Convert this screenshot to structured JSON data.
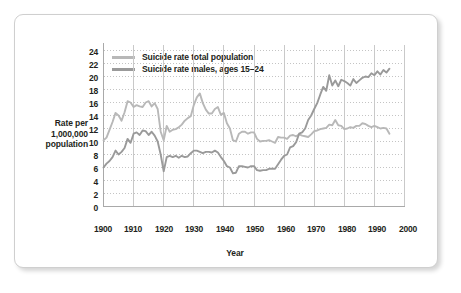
{
  "chart_data": {
    "type": "line",
    "title": "",
    "xlabel": "Year",
    "ylabel": "Rate per 1,000,000 population",
    "ylabel_lines": [
      "Rate per",
      "1,000,000",
      "population"
    ],
    "xlim": [
      1900,
      2000
    ],
    "ylim": [
      0,
      24
    ],
    "xticks": [
      1900,
      1910,
      1920,
      1930,
      1940,
      1950,
      1960,
      1970,
      1980,
      1990,
      2000
    ],
    "yticks": [
      0,
      2,
      4,
      6,
      8,
      10,
      12,
      14,
      16,
      18,
      20,
      22,
      24
    ],
    "grid": "horizontal dotted, vertical solid light gray",
    "legend_position": "top-left inside plot",
    "series": [
      {
        "name": "Suicide rate total population",
        "color": "#b8b8b8",
        "x": [
          1900,
          1901,
          1902,
          1903,
          1904,
          1905,
          1906,
          1907,
          1908,
          1909,
          1910,
          1911,
          1912,
          1913,
          1914,
          1915,
          1916,
          1917,
          1918,
          1919,
          1920,
          1921,
          1922,
          1923,
          1924,
          1925,
          1926,
          1927,
          1928,
          1929,
          1930,
          1931,
          1932,
          1933,
          1934,
          1935,
          1936,
          1937,
          1938,
          1939,
          1940,
          1941,
          1942,
          1943,
          1944,
          1945,
          1946,
          1947,
          1948,
          1949,
          1950,
          1951,
          1952,
          1953,
          1954,
          1955,
          1956,
          1957,
          1958,
          1959,
          1960,
          1961,
          1962,
          1963,
          1964,
          1965,
          1966,
          1967,
          1968,
          1969,
          1970,
          1971,
          1972,
          1973,
          1974,
          1975,
          1976,
          1977,
          1978,
          1979,
          1980,
          1981,
          1982,
          1983,
          1984,
          1985,
          1986,
          1987,
          1988,
          1989,
          1990,
          1991,
          1992,
          1993,
          1994,
          1995
        ],
        "y": [
          10.2,
          10.6,
          11.8,
          13.0,
          14.4,
          14.0,
          13.2,
          14.5,
          16.2,
          16.0,
          15.3,
          15.6,
          15.4,
          15.3,
          16.0,
          16.2,
          15.4,
          15.9,
          15.0,
          11.5,
          10.2,
          12.4,
          11.5,
          11.8,
          11.9,
          12.2,
          12.6,
          13.2,
          13.6,
          13.9,
          15.6,
          16.8,
          17.4,
          15.9,
          14.9,
          14.3,
          14.3,
          15.0,
          15.3,
          14.1,
          14.4,
          12.8,
          12.0,
          10.2,
          10.0,
          11.2,
          11.5,
          11.5,
          11.2,
          11.4,
          11.4,
          10.4,
          10.0,
          10.1,
          10.1,
          10.2,
          10.0,
          9.8,
          10.7,
          10.6,
          10.6,
          10.4,
          10.9,
          11.0,
          10.8,
          11.1,
          10.9,
          10.8,
          10.7,
          11.1,
          11.6,
          11.7,
          11.9,
          12.0,
          12.1,
          12.6,
          12.5,
          13.3,
          12.5,
          12.4,
          11.9,
          12.0,
          12.2,
          12.1,
          12.4,
          12.4,
          12.8,
          12.7,
          12.4,
          12.2,
          12.4,
          12.2,
          12.0,
          12.1,
          12.0,
          11.2
        ]
      },
      {
        "name": "Suicide rate males, ages 15–24",
        "color": "#9a9a9a",
        "x": [
          1900,
          1901,
          1902,
          1903,
          1904,
          1905,
          1906,
          1907,
          1908,
          1909,
          1910,
          1911,
          1912,
          1913,
          1914,
          1915,
          1916,
          1917,
          1918,
          1919,
          1920,
          1921,
          1922,
          1923,
          1924,
          1925,
          1926,
          1927,
          1928,
          1929,
          1930,
          1931,
          1932,
          1933,
          1934,
          1935,
          1936,
          1937,
          1938,
          1939,
          1940,
          1941,
          1942,
          1943,
          1944,
          1945,
          1946,
          1947,
          1948,
          1949,
          1950,
          1951,
          1952,
          1953,
          1954,
          1955,
          1956,
          1957,
          1958,
          1959,
          1960,
          1961,
          1962,
          1963,
          1964,
          1965,
          1966,
          1967,
          1968,
          1969,
          1970,
          1971,
          1972,
          1973,
          1974,
          1975,
          1976,
          1977,
          1978,
          1979,
          1980,
          1981,
          1982,
          1983,
          1984,
          1985,
          1986,
          1987,
          1988,
          1989,
          1990,
          1991,
          1992,
          1993,
          1994,
          1995
        ],
        "y": [
          6.0,
          6.6,
          7.0,
          7.6,
          8.6,
          8.0,
          8.4,
          9.0,
          10.4,
          9.8,
          11.2,
          11.4,
          11.0,
          11.7,
          11.6,
          11.0,
          11.5,
          10.9,
          10.0,
          8.0,
          5.4,
          7.6,
          7.8,
          7.6,
          7.8,
          7.5,
          7.8,
          7.6,
          7.7,
          8.2,
          8.6,
          8.6,
          8.4,
          8.2,
          8.4,
          8.4,
          8.3,
          8.6,
          8.3,
          7.6,
          7.0,
          6.2,
          6.0,
          5.1,
          5.2,
          6.2,
          6.2,
          6.1,
          6.0,
          6.2,
          6.2,
          5.6,
          5.5,
          5.6,
          5.6,
          5.8,
          5.8,
          5.8,
          6.5,
          7.2,
          7.8,
          8.0,
          9.1,
          9.3,
          9.9,
          11.2,
          11.4,
          12.0,
          13.3,
          14.0,
          15.0,
          15.9,
          17.2,
          18.4,
          17.8,
          20.2,
          18.6,
          19.4,
          18.5,
          19.5,
          19.3,
          19.0,
          18.6,
          19.6,
          19.0,
          19.4,
          19.8,
          20.0,
          19.9,
          20.5,
          20.2,
          20.8,
          20.3,
          21.0,
          20.6,
          21.2
        ]
      }
    ]
  },
  "legend": {
    "items": [
      {
        "label": "Suicide rate total population",
        "color": "#b8b8b8"
      },
      {
        "label": "Suicide rate males, ages 15–24",
        "color": "#9a9a9a"
      }
    ]
  },
  "axes": {
    "x_title": "Year",
    "y_title_lines": [
      "Rate per",
      "1,000,000",
      "population"
    ],
    "x_tick_labels": [
      "1900",
      "1910",
      "1920",
      "1930",
      "1940",
      "1950",
      "1960",
      "1970",
      "1980",
      "1990",
      "2000"
    ],
    "y_tick_labels": [
      "0",
      "2",
      "4",
      "6",
      "8",
      "10",
      "12",
      "14",
      "16",
      "18",
      "20",
      "22",
      "24"
    ]
  },
  "colors": {
    "total_population_line": "#b8b8b8",
    "males_line": "#9a9a9a",
    "axis": "#a9a9a9",
    "grid_dotted": "#c4c4c4",
    "grid_vertical": "#c9c9c9",
    "text": "#231f20",
    "frame_border": "#cfcfcf",
    "background": "#ffffff"
  }
}
